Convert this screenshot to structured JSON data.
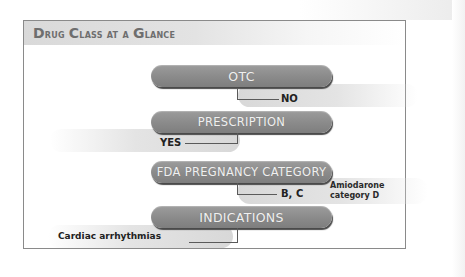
{
  "title": {
    "text": "Drug Class at a Glance",
    "parts": [
      {
        "cap": "D",
        "rest": "rug "
      },
      {
        "cap": "C",
        "rest": "lass at a "
      },
      {
        "cap": "G",
        "rest": "lance"
      }
    ]
  },
  "rows": [
    {
      "label": "OTC",
      "answer": "NO",
      "answer_side": "right"
    },
    {
      "label": "PRESCRIPTION",
      "answer": "YES",
      "answer_side": "left"
    },
    {
      "label": "FDA PREGNANCY CATEGORY",
      "answer": "B, C",
      "answer_side": "right",
      "note_line1": "Amiodarone",
      "note_line2": "category D"
    },
    {
      "label": "INDICATIONS",
      "answer": "Cardiac arrhythmias",
      "answer_side": "left"
    }
  ],
  "colors": {
    "pill": "#8a8a8a",
    "pill_text": "#f0f0f0",
    "frame_border": "#8a8a8a",
    "header_bg": "#d9d9d9",
    "header_text": "#6e6e6e",
    "answer_text": "#222222"
  }
}
